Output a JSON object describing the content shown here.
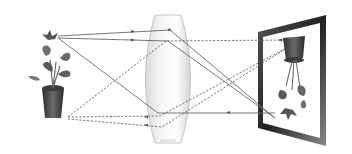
{
  "diagram": {
    "title": "",
    "type": "convex lens image formation",
    "elements": [
      {
        "id": "object",
        "label": "potted plant (object, upright)"
      },
      {
        "id": "lens",
        "label": "convex lens"
      },
      {
        "id": "screen",
        "label": "screen with inverted real image"
      }
    ],
    "rays": {
      "solid_from_top": 3,
      "dashed_from_bottom": 3
    },
    "colors": {
      "background": "#ffffff",
      "ray": "#666666",
      "lens_fill": "#eeeeef",
      "lens_edge": "#b8b8bc",
      "frame": "#3a3a3a",
      "plant_leaf": "#5a5a5a",
      "pot": "#4a4a4a"
    }
  }
}
